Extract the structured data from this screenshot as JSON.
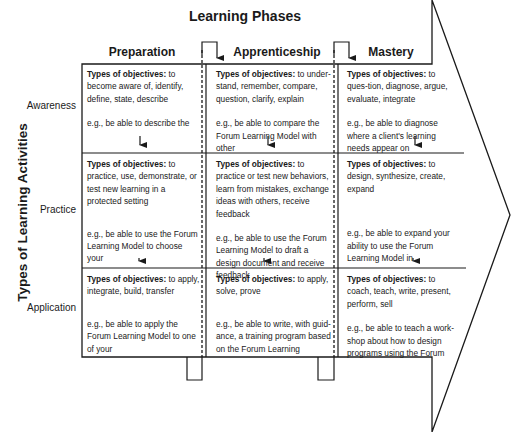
{
  "title": "Learning Phases",
  "y_axis_label": "Types of Learning Activities",
  "phases": [
    {
      "label": "Preparation"
    },
    {
      "label": "Apprenticeship"
    },
    {
      "label": "Mastery"
    }
  ],
  "rows": [
    {
      "label": "Awareness",
      "cells": [
        {
          "objectives_label": "Types of objectives:",
          "objectives": " to become aware of, identify, define, state, describe",
          "example": "e.g., be able to describe the"
        },
        {
          "objectives_label": "Types of objectives:",
          "objectives": " to under-stand, remember, compare, question, clarify, explain",
          "example": "e.g., be able to compare the Forum Learning Model with other"
        },
        {
          "objectives_label": "Types of objectives:",
          "objectives": " to ques-tion, diagnose, argue, evaluate, integrate",
          "example": "e.g., be able to diagnose where a client's learning needs appear on"
        }
      ]
    },
    {
      "label": "Practice",
      "cells": [
        {
          "objectives_label": "Types of objectives:",
          "objectives": " to practice, use, demonstrate, or test new learning in a protected setting",
          "example": "e.g., be able to use the Forum Learning Model to choose your"
        },
        {
          "objectives_label": "Types of objectives:",
          "objectives": " to practice or test new behaviors, learn from mistakes, exchange ideas with others, receive feedback",
          "example": "e.g., be able to use the Forum Learning Model to draft a design document and receive feedback"
        },
        {
          "objectives_label": "Types of objectives:",
          "objectives": " to design, synthesize, create, expand",
          "example": "e.g., be able to expand your ability to use the Forum Learning Model in"
        }
      ]
    },
    {
      "label": "Application",
      "cells": [
        {
          "objectives_label": "Types of objectives:",
          "objectives": " to apply, integrate, build, transfer",
          "example": "e.g., be able to apply the Forum Learning Model to one of your"
        },
        {
          "objectives_label": "Types of objectives:",
          "objectives": " to apply, solve, prove",
          "example": "e.g., be able to write, with guid-ance, a training program based on the Forum Learning"
        },
        {
          "objectives_label": "Types of objectives:",
          "objectives": " to coach, teach, write, present, perform, sell",
          "example": "e.g., be able to teach a work-shop about how to design programs using the Forum"
        }
      ]
    }
  ],
  "colors": {
    "line": "#1a1a1a",
    "background": "#ffffff"
  }
}
